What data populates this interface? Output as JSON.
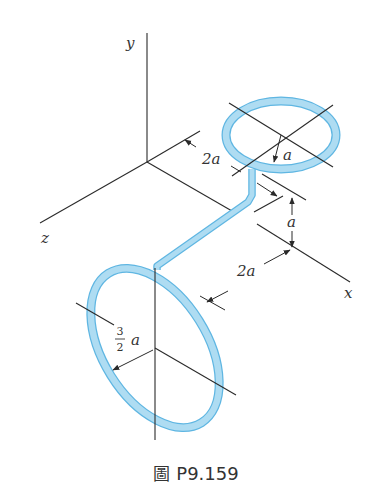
{
  "figure": {
    "caption_prefix": "圖",
    "caption_id": "P9.159",
    "axes": {
      "x": "x",
      "y": "y",
      "z": "z"
    },
    "dimensions": {
      "top_ring_radius": "a",
      "offset_to_upper_pipe": "2a",
      "vertical_offset": "a",
      "offset_to_lower_ring": "2a",
      "lower_ring_radius_num": "3",
      "lower_ring_radius_den": "2",
      "lower_ring_radius_var": "a"
    },
    "colors": {
      "tube_fill": "#aedcf2",
      "tube_outline": "#5fb6e2",
      "line": "#2a2a2a"
    }
  }
}
